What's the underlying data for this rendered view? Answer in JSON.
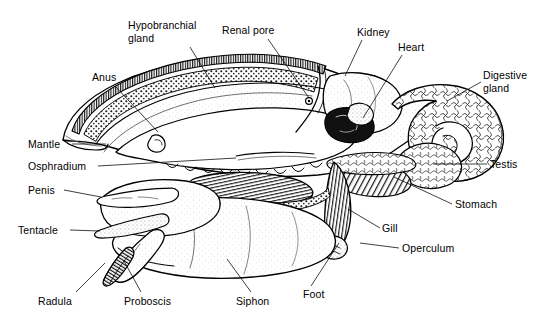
{
  "figure": {
    "background_color": "#ffffff",
    "ink_color": "#000000",
    "width": 543,
    "height": 325,
    "style": "black-and-white stipple and line engraving"
  },
  "labels": [
    {
      "id": "hypobranchial-gland",
      "text": "Hypobranchial\ngland",
      "lines": [
        "Hypobranchial",
        "gland"
      ],
      "align": "left",
      "x": 128,
      "y": 19,
      "leader": [
        [
          190,
          47
        ],
        [
          215,
          88
        ]
      ],
      "points_to": "thin glandular band along inner mantle roof"
    },
    {
      "id": "renal-pore",
      "text": "Renal pore",
      "lines": [
        "Renal pore"
      ],
      "align": "left",
      "x": 222,
      "y": 24,
      "leader": [
        [
          268,
          39
        ],
        [
          309,
          101
        ]
      ],
      "points_to": "small circular pore on mantle wall"
    },
    {
      "id": "kidney",
      "text": "Kidney",
      "lines": [
        "Kidney"
      ],
      "align": "left",
      "x": 357,
      "y": 26,
      "leader": [
        [
          362,
          40
        ],
        [
          345,
          76
        ]
      ],
      "points_to": "pale lobed mass above the heart"
    },
    {
      "id": "heart",
      "text": "Heart",
      "lines": [
        "Heart"
      ],
      "align": "left",
      "x": 398,
      "y": 41,
      "leader": [
        [
          402,
          55
        ],
        [
          363,
          118
        ]
      ],
      "points_to": "dark chambered organ in pericardium"
    },
    {
      "id": "digestive-gland",
      "text": "Digestive\ngland",
      "lines": [
        "Digestive",
        "gland"
      ],
      "align": "left",
      "x": 483,
      "y": 69,
      "leader": [
        [
          481,
          82
        ],
        [
          447,
          101
        ]
      ],
      "points_to": "large reticulated coiled mass at rear"
    },
    {
      "id": "anus",
      "text": "Anus",
      "lines": [
        "Anus"
      ],
      "align": "left",
      "x": 92,
      "y": 71,
      "leader": [
        [
          115,
          86
        ],
        [
          158,
          132
        ]
      ],
      "points_to": "opening at free edge of mantle cavity"
    },
    {
      "id": "mantle",
      "text": "Mantle",
      "lines": [
        "Mantle"
      ],
      "align": "left",
      "x": 28,
      "y": 138,
      "leader": [
        [
          70,
          144
        ],
        [
          106,
          144
        ]
      ],
      "points_to": "fleshy fold forming mantle cavity wall"
    },
    {
      "id": "osphradium",
      "text": "Osphradium",
      "lines": [
        "Osphradium"
      ],
      "align": "left",
      "x": 28,
      "y": 160,
      "leader": [
        [
          96,
          166
        ],
        [
          236,
          160
        ]
      ],
      "points_to": "sensory ridge in mantle cavity"
    },
    {
      "id": "penis",
      "text": "Penis",
      "lines": [
        "Penis"
      ],
      "align": "left",
      "x": 28,
      "y": 184,
      "leader": [
        [
          64,
          190
        ],
        [
          100,
          196
        ]
      ],
      "points_to": "elongate tapering organ behind right tentacle"
    },
    {
      "id": "tentacle",
      "text": "Tentacle",
      "lines": [
        "Tentacle"
      ],
      "align": "left",
      "x": 18,
      "y": 224,
      "leader": [
        [
          69,
          230
        ],
        [
          99,
          230
        ]
      ],
      "points_to": "pointed cephalic tentacle"
    },
    {
      "id": "radula",
      "text": "Radula",
      "lines": [
        "Radula"
      ],
      "align": "left",
      "x": 38,
      "y": 295,
      "leader": [
        [
          75,
          292
        ],
        [
          104,
          262
        ]
      ],
      "points_to": "toothed ribbon inside proboscis tip"
    },
    {
      "id": "proboscis",
      "text": "Proboscis",
      "lines": [
        "Proboscis"
      ],
      "align": "left",
      "x": 124,
      "y": 295,
      "leader": [
        [
          140,
          292
        ],
        [
          124,
          261
        ]
      ],
      "points_to": "extensible feeding tube"
    },
    {
      "id": "siphon",
      "text": "Siphon",
      "lines": [
        "Siphon"
      ],
      "align": "left",
      "x": 236,
      "y": 295,
      "leader": [
        [
          250,
          292
        ],
        [
          226,
          258
        ]
      ],
      "points_to": "inhalant tube of the mantle"
    },
    {
      "id": "foot",
      "text": "Foot",
      "lines": [
        "Foot"
      ],
      "align": "left",
      "x": 303,
      "y": 288,
      "leader": [
        [
          310,
          286
        ],
        [
          339,
          243
        ]
      ],
      "points_to": "broad muscular creeping sole"
    },
    {
      "id": "operculum",
      "text": "Operculum",
      "lines": [
        "Operculum"
      ],
      "align": "left",
      "x": 402,
      "y": 242,
      "leader": [
        [
          399,
          248
        ],
        [
          361,
          242
        ]
      ],
      "points_to": "horny plate on rear of foot"
    },
    {
      "id": "gill",
      "text": "Gill",
      "lines": [
        "Gill"
      ],
      "align": "left",
      "x": 382,
      "y": 222,
      "leader": [
        [
          380,
          228
        ],
        [
          348,
          208
        ]
      ],
      "points_to": "ridged ctenidium in mantle cavity"
    },
    {
      "id": "stomach",
      "text": "Stomach",
      "lines": [
        "Stomach"
      ],
      "align": "left",
      "x": 455,
      "y": 198,
      "leader": [
        [
          452,
          204
        ],
        [
          394,
          176
        ]
      ],
      "points_to": "hatched sac between gland and intestine"
    },
    {
      "id": "testis",
      "text": "Testis",
      "lines": [
        "Testis"
      ],
      "align": "left",
      "x": 490,
      "y": 158,
      "leader": [
        [
          487,
          164
        ],
        [
          432,
          164
        ]
      ],
      "points_to": "gonad lobe at base of visceral coil"
    }
  ]
}
